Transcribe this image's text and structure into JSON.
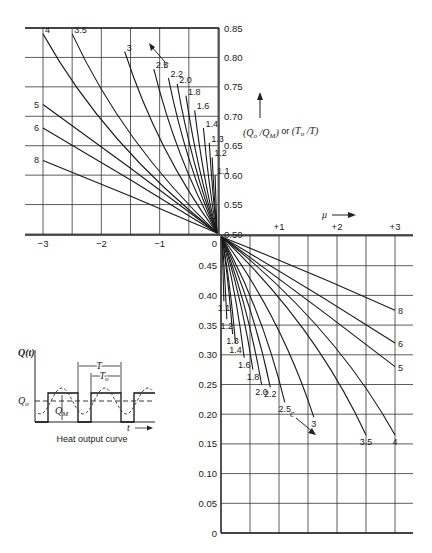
{
  "chart_data": {
    "type": "line",
    "title": "",
    "y_axis_label": "(Q_o/Q_M) or (T_o/T)",
    "x_axis_label": "μ",
    "parameter_label": "c",
    "upper_left_panel": {
      "x_ticks": [
        "-3",
        "-2",
        "-1",
        "0"
      ],
      "x_range": [
        -3,
        0
      ],
      "y_ticks": [
        "0.50",
        "0.55",
        "0.60",
        "0.65",
        "0.70",
        "0.75",
        "0.80",
        "0.85"
      ],
      "y_range": [
        0.5,
        0.85
      ],
      "grid": true,
      "series": [
        {
          "name": "1.1",
          "start": [
            -0.05,
            0.6
          ]
        },
        {
          "name": "1.2",
          "start": [
            -0.1,
            0.63
          ]
        },
        {
          "name": "1.3",
          "start": [
            -0.15,
            0.655
          ]
        },
        {
          "name": "1.4",
          "start": [
            -0.25,
            0.68
          ]
        },
        {
          "name": "1.6",
          "start": [
            -0.4,
            0.71
          ]
        },
        {
          "name": "1.8",
          "start": [
            -0.55,
            0.735
          ]
        },
        {
          "name": "2.0",
          "start": [
            -0.7,
            0.755
          ]
        },
        {
          "name": "2.2",
          "start": [
            -0.85,
            0.765
          ]
        },
        {
          "name": "2.5",
          "start": [
            -1.1,
            0.78
          ]
        },
        {
          "name": "3",
          "start": [
            -1.6,
            0.81
          ]
        },
        {
          "name": "3.5",
          "start": [
            -2.5,
            0.84
          ]
        },
        {
          "name": "4",
          "start": [
            -3.0,
            0.84
          ]
        },
        {
          "name": "5",
          "start": [
            -3.0,
            0.72
          ]
        },
        {
          "name": "6",
          "start": [
            -3.0,
            0.68
          ]
        },
        {
          "name": "8",
          "start": [
            -3.0,
            0.625
          ]
        }
      ]
    },
    "lower_right_panel": {
      "x_ticks": [
        "0",
        "+1",
        "+2",
        "+3"
      ],
      "x_range": [
        0,
        3.3
      ],
      "y_ticks": [
        "0",
        "0.05",
        "0.10",
        "0.15",
        "0.20",
        "0.25",
        "0.30",
        "0.35",
        "0.40",
        "0.45",
        "0.50"
      ],
      "y_range": [
        0,
        0.5
      ],
      "grid": true,
      "series": [
        {
          "name": "1.1",
          "end": [
            0.05,
            0.39
          ]
        },
        {
          "name": "1.2",
          "end": [
            0.1,
            0.36
          ]
        },
        {
          "name": "1.3",
          "end": [
            0.2,
            0.335
          ]
        },
        {
          "name": "1.4",
          "end": [
            0.25,
            0.32
          ]
        },
        {
          "name": "1.6",
          "end": [
            0.4,
            0.295
          ]
        },
        {
          "name": "1.8",
          "end": [
            0.55,
            0.275
          ]
        },
        {
          "name": "2.0",
          "end": [
            0.7,
            0.25
          ]
        },
        {
          "name": "2.2",
          "end": [
            0.85,
            0.245
          ]
        },
        {
          "name": "2.5",
          "end": [
            1.1,
            0.22
          ]
        },
        {
          "name": "3",
          "end": [
            1.6,
            0.195
          ]
        },
        {
          "name": "3.5",
          "end": [
            2.5,
            0.165
          ]
        },
        {
          "name": "4",
          "end": [
            3.0,
            0.165
          ]
        },
        {
          "name": "5",
          "end": [
            3.0,
            0.28
          ]
        },
        {
          "name": "6",
          "end": [
            3.0,
            0.32
          ]
        },
        {
          "name": "8",
          "end": [
            3.0,
            0.375
          ]
        }
      ]
    }
  },
  "labels": {
    "y_axis_label_main": "(Q",
    "y_axis_label_full": "(Qₒ / Qₘ) or (Tₒ / T)",
    "mu_label": "μ",
    "c_label": "c",
    "zero_label": "0"
  },
  "inset": {
    "caption": "Heat output curve",
    "y_label": "Q(t)",
    "t_label": "t",
    "Q_o_label": "Q",
    "Q_o_sub": "o",
    "Q_M_label": "Q",
    "Q_M_sub": "M",
    "T_label": "T",
    "T_o_label": "T",
    "T_o_sub": "o"
  }
}
